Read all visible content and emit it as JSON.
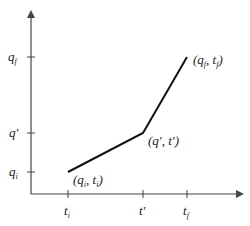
{
  "diagram": {
    "type": "piecewise-linear path",
    "colors": {
      "axis": "#444444",
      "path": "#111111",
      "text": "#222222"
    },
    "y_axis_ticks": [
      {
        "label": "q",
        "sub": "f",
        "prime": "",
        "y": 57
      },
      {
        "label": "q",
        "sub": "",
        "prime": "′",
        "y": 133
      },
      {
        "label": "q",
        "sub": "i",
        "prime": "",
        "y": 172
      }
    ],
    "x_axis_ticks": [
      {
        "label": "t",
        "sub": "i",
        "prime": "",
        "x": 68
      },
      {
        "label": "t",
        "sub": "",
        "prime": "′",
        "x": 143
      },
      {
        "label": "t",
        "sub": "f",
        "prime": "",
        "x": 187
      }
    ],
    "points": [
      {
        "label": "(q_i, t_i)",
        "x": 68,
        "y": 172
      },
      {
        "label": "(q′, t′)",
        "x": 143,
        "y": 133
      },
      {
        "label": "(q_f, t_f)",
        "x": 187,
        "y": 57
      }
    ],
    "point_labels": {
      "p1": {
        "open": "(q",
        "s1": "i",
        "mid": ", t",
        "s2": "i",
        "close": ")"
      },
      "p2": {
        "text": "(q′, t′)"
      },
      "p3": {
        "open": "(q",
        "s1": "f",
        "mid": ", t",
        "s2": "f",
        "close": ")"
      }
    },
    "tick_text": {
      "qf": "q",
      "qf_sub": "f",
      "qp": "q′",
      "qi": "q",
      "qi_sub": "i",
      "ti": "t",
      "ti_sub": "i",
      "tp": "t′",
      "tf": "t",
      "tf_sub": "f"
    }
  }
}
